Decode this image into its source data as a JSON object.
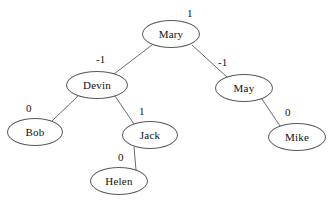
{
  "diagram": {
    "background_color": "#ffffff",
    "node_stroke_color": "#5a5a5a",
    "edge_color": "#6b6b6b",
    "text_color": "#111111"
  },
  "nodes": [
    {
      "id": "mary",
      "label": "Mary",
      "balance_factor": "1",
      "cx": 171,
      "cy": 34,
      "rx": 29,
      "ry": 14
    },
    {
      "id": "devin",
      "label": "Devin",
      "balance_factor": "-1",
      "cx": 97,
      "cy": 85,
      "rx": 31,
      "ry": 14
    },
    {
      "id": "may",
      "label": "May",
      "balance_factor": "-1",
      "cx": 244,
      "cy": 88,
      "rx": 29,
      "ry": 14
    },
    {
      "id": "bob",
      "label": "Bob",
      "balance_factor": "0",
      "cx": 35,
      "cy": 132,
      "rx": 28,
      "ry": 14
    },
    {
      "id": "jack",
      "label": "Jack",
      "balance_factor": "1",
      "cx": 150,
      "cy": 135,
      "rx": 28,
      "ry": 14
    },
    {
      "id": "mike",
      "label": "Mike",
      "balance_factor": "0",
      "cx": 297,
      "cy": 137,
      "rx": 29,
      "ry": 14
    },
    {
      "id": "helen",
      "label": "Helen",
      "balance_factor": "0",
      "cx": 119,
      "cy": 181,
      "rx": 29,
      "ry": 14
    }
  ],
  "balance_labels": [
    {
      "for": "mary",
      "text": "1",
      "x": 187,
      "y": 8
    },
    {
      "for": "devin",
      "text": "-1",
      "x": 96,
      "y": 54
    },
    {
      "for": "may",
      "text": "-1",
      "x": 218,
      "y": 57
    },
    {
      "for": "bob",
      "text": "0",
      "x": 26,
      "y": 103
    },
    {
      "for": "jack",
      "text": "1",
      "x": 139,
      "y": 106
    },
    {
      "for": "mike",
      "text": "0",
      "x": 285,
      "y": 107
    },
    {
      "for": "helen",
      "text": "0",
      "x": 118,
      "y": 152
    }
  ],
  "edges": [
    {
      "from": "mary",
      "to": "devin",
      "x1": 152,
      "y1": 45,
      "x2": 114,
      "y2": 74
    },
    {
      "from": "mary",
      "to": "may",
      "x1": 192,
      "y1": 45,
      "x2": 228,
      "y2": 78
    },
    {
      "from": "devin",
      "to": "bob",
      "x1": 78,
      "y1": 96,
      "x2": 52,
      "y2": 121
    },
    {
      "from": "devin",
      "to": "jack",
      "x1": 115,
      "y1": 96,
      "x2": 134,
      "y2": 124
    },
    {
      "from": "may",
      "to": "mike",
      "x1": 262,
      "y1": 99,
      "x2": 280,
      "y2": 126
    },
    {
      "from": "jack",
      "to": "helen",
      "x1": 134,
      "y1": 147,
      "x2": 136,
      "y2": 170
    }
  ]
}
